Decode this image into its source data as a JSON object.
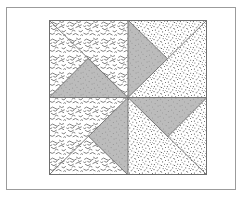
{
  "figure": {
    "title": "Pinwheel Quilt Block",
    "frame": {
      "label": "figure-border",
      "x": 6,
      "y": 7,
      "width": 230,
      "height": 183,
      "stroke": "#9b9b9b",
      "stroke_width": 1,
      "fill": "#ffffff"
    },
    "block": {
      "label": "quilt-block",
      "x": 49,
      "y": 20,
      "width": 158,
      "height": 155,
      "outline_stroke": "#6e6e6e",
      "outline_width": 1,
      "center_x": 79,
      "center_y": 77.5
    },
    "colors": {
      "paper": "#ffffff",
      "frame_line": "#9b9b9b",
      "block_line": "#6e6e6e",
      "shaded_gray": "#b8b8b8",
      "texture_ink": "#5a5a5a"
    },
    "quadrants": [
      {
        "name": "top-left",
        "texture": "squiggle",
        "diagonal": "top-left-to-bottom-right",
        "shaded_triangle": "lower-left half",
        "shaded_apex": "up"
      },
      {
        "name": "top-right",
        "texture": "speckle",
        "diagonal": "top-right-to-bottom-left",
        "shaded_triangle": "left half",
        "shaded_apex": "right"
      },
      {
        "name": "bottom-left",
        "texture": "squiggle",
        "diagonal": "bottom-left-to-top-right",
        "shaded_triangle": "right half",
        "shaded_apex": "left"
      },
      {
        "name": "bottom-right",
        "texture": "speckle",
        "diagonal": "bottom-right-to-top-left",
        "shaded_triangle": "upper half",
        "shaded_apex": "down"
      }
    ],
    "grid_lines": {
      "vertical_midline": "x = 79 (block coords)",
      "horizontal_midline": "y = 77.5 (block coords)"
    }
  }
}
